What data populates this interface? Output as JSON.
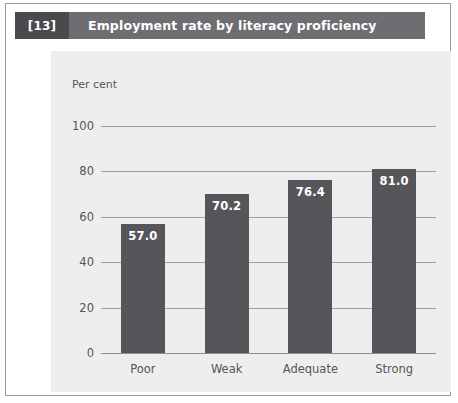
{
  "figure": {
    "number": "[13]",
    "title": "Employment rate by literacy proficiency"
  },
  "colors": {
    "title_bar": "#6e6e72",
    "figure_number_block": "#4a4a4e",
    "panel_background": "#eeeeee",
    "bar": "#56565a",
    "gridline": "#9e9ea2",
    "text": "#555558",
    "frame_border": "#9a9a9a"
  },
  "chart_data": {
    "type": "bar",
    "title": "Employment rate by literacy proficiency",
    "xlabel": "",
    "ylabel": "Per cent",
    "categories": [
      "Poor",
      "Weak",
      "Adequate",
      "Strong"
    ],
    "values": [
      57.0,
      70.2,
      76.4,
      81.0
    ],
    "value_labels": [
      "57.0",
      "70.2",
      "76.4",
      "81.0"
    ],
    "ylim": [
      0,
      100
    ],
    "yticks": [
      0,
      20,
      40,
      60,
      80,
      100
    ],
    "ytick_labels": [
      "0",
      "20",
      "40",
      "60",
      "80",
      "100"
    ],
    "grid": true,
    "legend": false,
    "legend_position": "none"
  }
}
